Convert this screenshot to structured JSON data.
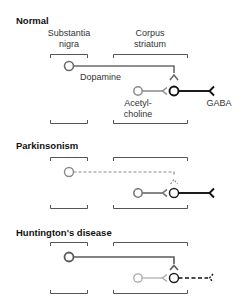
{
  "labels": {
    "substantia_line1": "Substantia",
    "substantia_line2": "nigra",
    "corpus_line1": "Corpus",
    "corpus_line2": "striatum",
    "dopamine": "Dopamine",
    "acetyl_line1": "Acetyl-",
    "acetyl_line2": "choline",
    "gaba": "GABA"
  },
  "panels": [
    {
      "title": "Normal",
      "dopamine_state": "normal",
      "acetylcholine_state": "normal",
      "gaba_state": "normal"
    },
    {
      "title": "Parkinsonism",
      "dopamine_state": "degenerated (dashed)",
      "acetylcholine_state": "normal",
      "gaba_state": "normal"
    },
    {
      "title": "Huntington's disease",
      "dopamine_state": "normal",
      "acetylcholine_state": "reduced (light)",
      "gaba_state": "degenerated (dashed)"
    }
  ],
  "colors": {
    "dopamine": "#6b6b6b",
    "acetylcholine": "#8a8a8a",
    "acetylcholine_faded": "#a8a8a8",
    "gaba": "#111111",
    "bracket": "#555555"
  }
}
